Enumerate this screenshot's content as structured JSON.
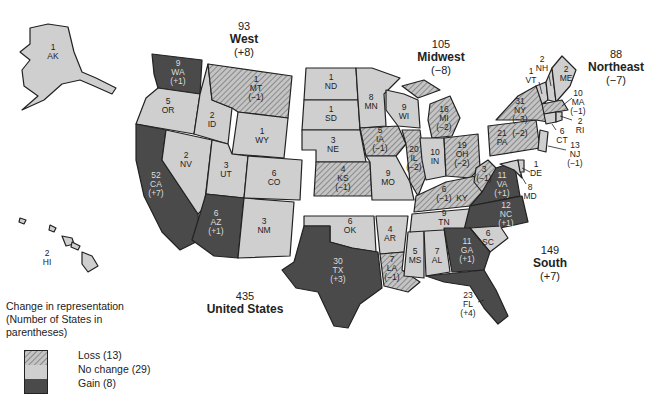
{
  "regions": {
    "west": {
      "total": "93",
      "name": "West",
      "change": "(+8)"
    },
    "midwest": {
      "total": "105",
      "name": "Midwest",
      "change": "(−8)"
    },
    "northeast": {
      "total": "88",
      "name": "Northeast",
      "change": "(−7)"
    },
    "south": {
      "total": "149",
      "name": "South",
      "change": "(+7)"
    },
    "us": {
      "total": "435",
      "name": "United States"
    }
  },
  "legend": {
    "title_line1": "Change in representation",
    "title_line2": "(Number of States in",
    "title_line3": "parentheses)",
    "loss": "Loss (13)",
    "no_change": "No change (29)",
    "gain": "Gain (8)"
  },
  "colors": {
    "gain": "#4a4a4a",
    "no_change": "#cfcfcf",
    "loss_bg": "#bdbdbd",
    "border": "#222222"
  },
  "states": {
    "AK": {
      "seats": "1",
      "abbr": "AK",
      "change": ""
    },
    "WA": {
      "seats": "9",
      "abbr": "WA",
      "change": "(+1)"
    },
    "OR": {
      "seats": "5",
      "abbr": "OR",
      "change": ""
    },
    "CA": {
      "seats": "52",
      "abbr": "CA",
      "change": "(+7)"
    },
    "ID": {
      "seats": "2",
      "abbr": "ID",
      "change": ""
    },
    "NV": {
      "seats": "2",
      "abbr": "NV",
      "change": ""
    },
    "MT": {
      "seats": "1",
      "abbr": "MT",
      "change": "(−1)"
    },
    "WY": {
      "seats": "1",
      "abbr": "WY",
      "change": ""
    },
    "UT": {
      "seats": "3",
      "abbr": "UT",
      "change": ""
    },
    "CO": {
      "seats": "6",
      "abbr": "CO",
      "change": ""
    },
    "AZ": {
      "seats": "6",
      "abbr": "AZ",
      "change": "(+1)"
    },
    "NM": {
      "seats": "3",
      "abbr": "NM",
      "change": ""
    },
    "HI": {
      "seats": "2",
      "abbr": "HI",
      "change": ""
    },
    "ND": {
      "seats": "1",
      "abbr": "ND",
      "change": ""
    },
    "SD": {
      "seats": "1",
      "abbr": "SD",
      "change": ""
    },
    "NE": {
      "seats": "3",
      "abbr": "NE",
      "change": ""
    },
    "KS": {
      "seats": "4",
      "abbr": "KS",
      "change": "(−1)"
    },
    "MN": {
      "seats": "8",
      "abbr": "MN",
      "change": ""
    },
    "IA": {
      "seats": "5",
      "abbr": "IA",
      "change": "(−1)"
    },
    "MO": {
      "seats": "9",
      "abbr": "MO",
      "change": ""
    },
    "WI": {
      "seats": "9",
      "abbr": "WI",
      "change": ""
    },
    "IL": {
      "seats": "20",
      "abbr": "IL",
      "change": "(−2)"
    },
    "MI": {
      "seats": "16",
      "abbr": "MI",
      "change": "(−2)"
    },
    "IN": {
      "seats": "10",
      "abbr": "IN",
      "change": ""
    },
    "OH": {
      "seats": "19",
      "abbr": "OH",
      "change": "(−2)"
    },
    "OK": {
      "seats": "6",
      "abbr": "OK",
      "change": ""
    },
    "TX": {
      "seats": "30",
      "abbr": "TX",
      "change": "(+3)"
    },
    "AR": {
      "seats": "4",
      "abbr": "AR",
      "change": ""
    },
    "LA": {
      "seats": "7",
      "abbr": "LA",
      "change": "(−1)"
    },
    "MS": {
      "seats": "5",
      "abbr": "MS",
      "change": ""
    },
    "AL": {
      "seats": "7",
      "abbr": "AL",
      "change": ""
    },
    "TN": {
      "seats": "9",
      "abbr": "TN",
      "change": ""
    },
    "KY": {
      "seats": "6",
      "abbr": "KY",
      "change": "(−1)"
    },
    "WV": {
      "seats": "3",
      "abbr": "WV",
      "change": "(−1)"
    },
    "VA": {
      "seats": "11",
      "abbr": "VA",
      "change": "(+1)"
    },
    "NC": {
      "seats": "12",
      "abbr": "NC",
      "change": "(+1)"
    },
    "SC": {
      "seats": "6",
      "abbr": "SC",
      "change": ""
    },
    "GA": {
      "seats": "11",
      "abbr": "GA",
      "change": "(+1)"
    },
    "FL": {
      "seats": "23",
      "abbr": "FL",
      "change": "(+4)"
    },
    "PA": {
      "seats": "21",
      "abbr": "PA",
      "change": "(−2)"
    },
    "NY": {
      "seats": "31",
      "abbr": "NY",
      "change": "(−3)"
    },
    "VT": {
      "seats": "1",
      "abbr": "VT",
      "change": ""
    },
    "NH": {
      "seats": "2",
      "abbr": "NH",
      "change": ""
    },
    "ME": {
      "seats": "2",
      "abbr": "ME",
      "change": ""
    },
    "MA": {
      "seats": "10",
      "abbr": "MA",
      "change": "(−1)"
    },
    "RI": {
      "seats": "2",
      "abbr": "RI",
      "change": ""
    },
    "CT": {
      "seats": "6",
      "abbr": "CT",
      "change": ""
    },
    "NJ": {
      "seats": "13",
      "abbr": "NJ",
      "change": "(−1)"
    },
    "DE": {
      "seats": "1",
      "abbr": "DE",
      "change": ""
    },
    "MD": {
      "seats": "8",
      "abbr": "MD",
      "change": ""
    }
  }
}
